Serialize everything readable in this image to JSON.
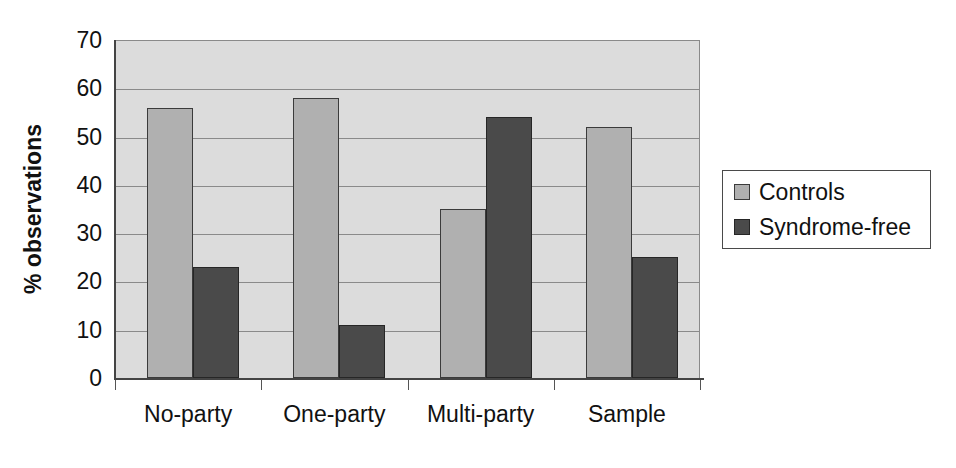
{
  "chart_data": {
    "type": "bar",
    "title": "",
    "subtitle": "",
    "xlabel": "",
    "ylabel": "% observations",
    "categories": [
      "No-party",
      "One-party",
      "Multi-party",
      "Sample"
    ],
    "series": [
      {
        "name": "Controls",
        "color": "#b0b0b0",
        "values": [
          56,
          58,
          35,
          52
        ]
      },
      {
        "name": "Syndrome-free",
        "color": "#4a4a4a",
        "values": [
          23,
          11,
          54,
          25
        ]
      }
    ],
    "ylim": [
      0,
      70
    ],
    "ytick_values": [
      0,
      10,
      20,
      30,
      40,
      50,
      60,
      70
    ],
    "ytick_labels": [
      "0",
      "10",
      "20",
      "30",
      "40",
      "50",
      "60",
      "70"
    ],
    "grid": "horizontal",
    "legend_position": "right",
    "plot_background": "#dcdcdc",
    "page_background": "#ffffff",
    "axis_color": "#444444",
    "gridline_color": "#8a8a8a"
  },
  "axes": {
    "y_title": "% observations"
  },
  "legend": {
    "entries": [
      {
        "label": "Controls"
      },
      {
        "label": "Syndrome-free"
      }
    ]
  }
}
